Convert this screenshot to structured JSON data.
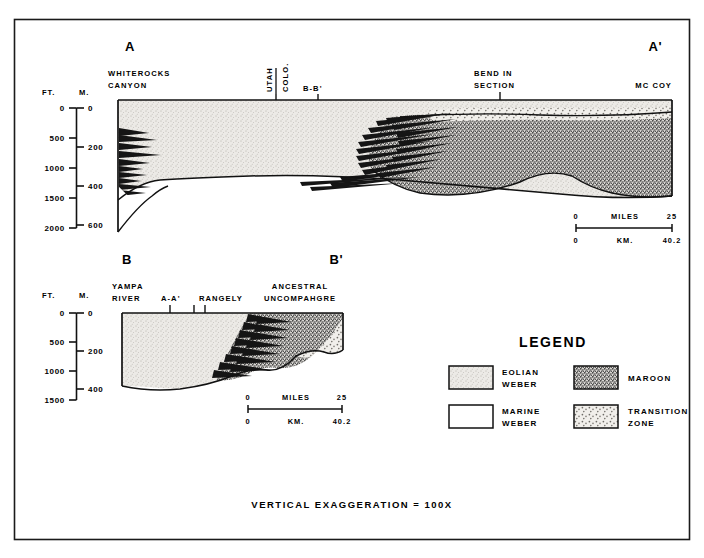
{
  "figure": {
    "caption": "VERTICAL EXAGGERATION = 100X",
    "border_color": "#1a1a1a",
    "background": "#ffffff"
  },
  "colors": {
    "eolian_weber": "#e3e1dc",
    "marine_weber": "#ffffff",
    "maroon": "#6b6b6b",
    "transition_zone": "#c9c7c2",
    "line": "#111111"
  },
  "sections": [
    {
      "id": "A-A'",
      "left_label": "A",
      "right_label": "A'",
      "axis": {
        "ft_label": "FT.",
        "m_label": "M.",
        "ft_ticks": [
          "0",
          "500",
          "1000",
          "1500",
          "2000"
        ],
        "m_ticks": [
          "0",
          "200",
          "400",
          "600"
        ]
      },
      "locality_labels": [
        {
          "name": "WHITEROCKS CANYON",
          "lines": [
            "WHITEROCKS",
            "CANYON"
          ],
          "tick": false
        },
        {
          "name": "UTAH",
          "lines": [
            "UTAH"
          ],
          "rotated": true,
          "tick": true
        },
        {
          "name": "COLO.",
          "lines": [
            "COLO."
          ],
          "rotated": true,
          "tick": false
        },
        {
          "name": "B-B'",
          "lines": [
            "B-B'"
          ],
          "tick": true
        },
        {
          "name": "BEND IN SECTION",
          "lines": [
            "BEND IN",
            "SECTION"
          ],
          "tick": true
        },
        {
          "name": "MC COY",
          "lines": [
            "MC COY"
          ],
          "tick": false
        }
      ],
      "scale": {
        "miles_label": "MILES",
        "km_label": "KM.",
        "miles_min": "0",
        "miles_max": "25",
        "km_min": "0",
        "km_max": "40.2"
      }
    },
    {
      "id": "B-B'",
      "left_label": "B",
      "right_label": "B'",
      "axis": {
        "ft_label": "FT.",
        "m_label": "M.",
        "ft_ticks": [
          "0",
          "500",
          "1000",
          "1500"
        ],
        "m_ticks": [
          "0",
          "200",
          "400"
        ]
      },
      "locality_labels": [
        {
          "name": "YAMPA RIVER",
          "lines": [
            "YAMPA",
            "RIVER"
          ],
          "tick": false
        },
        {
          "name": "A-A'",
          "lines": [
            "A-A'"
          ],
          "tick": true
        },
        {
          "name": "RANGELY",
          "lines": [
            "RANGELY"
          ],
          "tick": true
        },
        {
          "name": "ANCESTRAL UNCOMPAHGRE",
          "lines": [
            "ANCESTRAL",
            "UNCOMPAHGRE"
          ],
          "tick": false
        }
      ],
      "scale": {
        "miles_label": "MILES",
        "km_label": "KM.",
        "miles_min": "0",
        "miles_max": "25",
        "km_min": "0",
        "km_max": "40.2"
      }
    }
  ],
  "legend": {
    "title": "LEGEND",
    "items": [
      {
        "key": "eolian-weber",
        "lines": [
          "EOLIAN",
          "WEBER"
        ],
        "pattern": "stipple-fine"
      },
      {
        "key": "maroon",
        "lines": [
          "MAROON"
        ],
        "pattern": "stipple-dense"
      },
      {
        "key": "marine-weber",
        "lines": [
          "MARINE",
          "WEBER"
        ],
        "pattern": "blank"
      },
      {
        "key": "transition-zone",
        "lines": [
          "TRANSITION",
          "ZONE"
        ],
        "pattern": "stipple-coarse"
      }
    ]
  }
}
